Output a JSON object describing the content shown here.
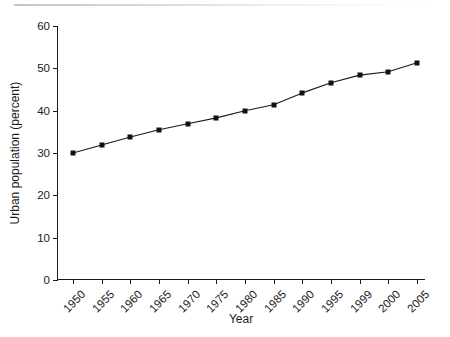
{
  "chart_data": {
    "type": "line",
    "title": "",
    "xlabel": "Year",
    "ylabel": "Urban population (percent)",
    "categories": [
      "1950",
      "1955",
      "1960",
      "1965",
      "1970",
      "1975",
      "1980",
      "1985",
      "1990",
      "1995",
      "1999",
      "2000",
      "2005"
    ],
    "values": [
      30.0,
      31.9,
      33.8,
      35.5,
      36.9,
      38.3,
      40.0,
      41.4,
      44.2,
      46.6,
      48.4,
      49.2,
      51.3
    ],
    "ylim": [
      0,
      60
    ],
    "y_ticks": [
      0,
      10,
      20,
      30,
      40,
      50,
      60
    ],
    "y_tick_labels": [
      "0",
      "10",
      "20",
      "30",
      "40",
      "50",
      "60"
    ],
    "grid": false,
    "legend": false,
    "legend_position": "none",
    "marker": "square",
    "marker_color": "#111111",
    "line_color": "#1a1a1a",
    "x_tick_label_rotation": -45,
    "spines": [
      "left",
      "bottom"
    ]
  }
}
